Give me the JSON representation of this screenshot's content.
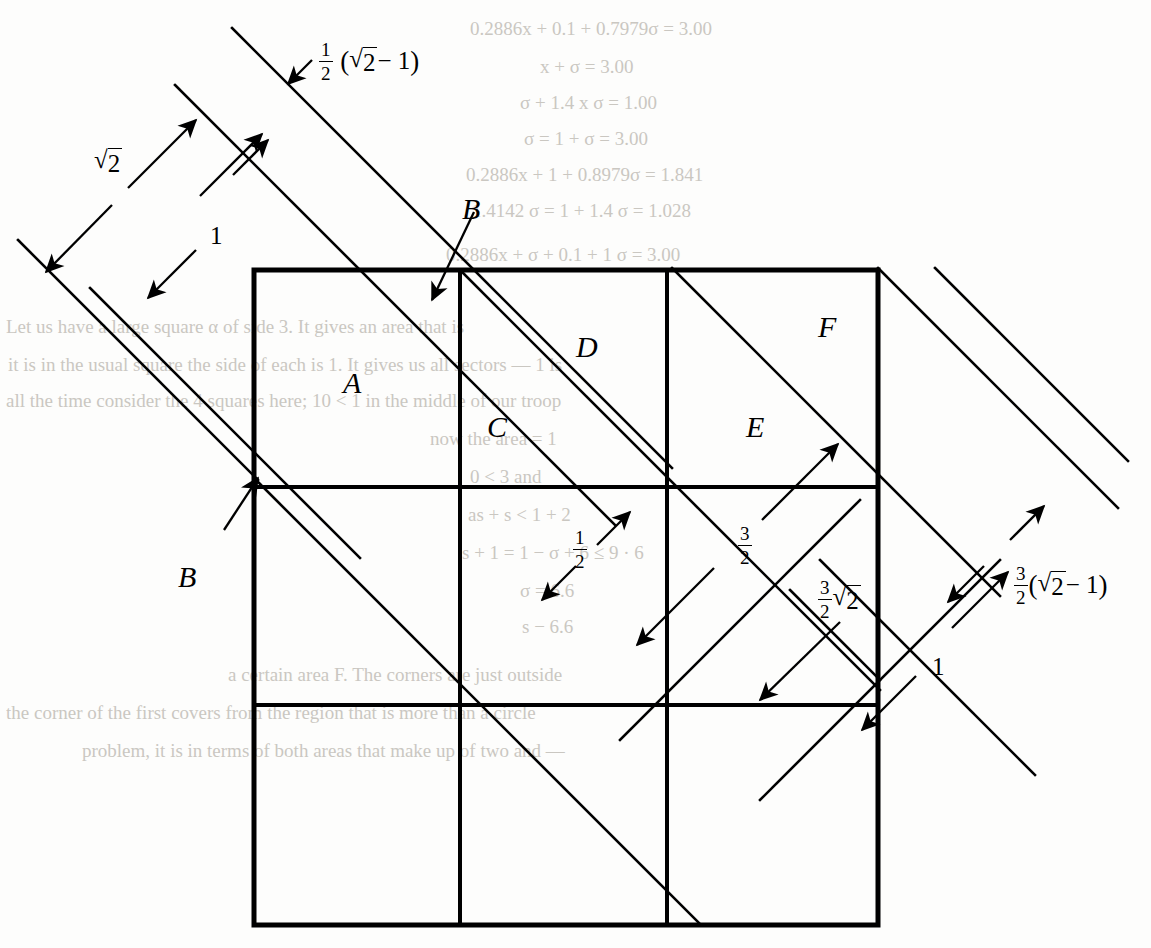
{
  "figure": {
    "grid": {
      "columns": 3,
      "rows": 3,
      "left": 254,
      "top": 270,
      "right": 878,
      "bottom": 925,
      "v_lines": [
        460,
        667
      ],
      "h_lines": [
        487,
        705
      ],
      "stroke": "#000000",
      "outer_width": 5,
      "inner_width": 4
    },
    "region_labels": [
      {
        "id": "A",
        "text": "A",
        "x": 343,
        "y": 366
      },
      {
        "id": "C",
        "text": "C",
        "x": 487,
        "y": 410
      },
      {
        "id": "D",
        "text": "D",
        "x": 576,
        "y": 330
      },
      {
        "id": "E",
        "text": "E",
        "x": 746,
        "y": 410
      },
      {
        "id": "F",
        "text": "F",
        "x": 818,
        "y": 310
      },
      {
        "id": "B_top",
        "text": "B",
        "x": 462,
        "y": 192
      },
      {
        "id": "B_left",
        "text": "B",
        "x": 178,
        "y": 560
      }
    ],
    "measure_labels": [
      {
        "id": "sqrt2",
        "kind": "radical",
        "text": "√2",
        "x": 94,
        "y": 148
      },
      {
        "id": "one_left",
        "kind": "plain",
        "text": "1",
        "x": 210,
        "y": 222
      },
      {
        "id": "half_sqrt2m1",
        "kind": "compound",
        "text": "½ (√2 − 1)",
        "x": 318,
        "y": 46
      },
      {
        "id": "one_half",
        "kind": "fraction",
        "text": "1/2",
        "x": 572,
        "y": 541
      },
      {
        "id": "three_half",
        "kind": "fraction",
        "text": "3/2",
        "x": 737,
        "y": 537
      },
      {
        "id": "three_half_sqrt2",
        "kind": "compound",
        "text": "3/2 √2",
        "x": 817,
        "y": 592
      },
      {
        "id": "three_half_sqrt2m1",
        "kind": "compound",
        "text": "3/2(√2 − 1)",
        "x": 1013,
        "y": 578
      },
      {
        "id": "one_right",
        "kind": "plain",
        "text": "1",
        "x": 932,
        "y": 653
      }
    ],
    "fraction_parts": {
      "half_num": "1",
      "half_den": "2",
      "three_half_num": "3",
      "three_half_den": "2"
    },
    "radical_parts": {
      "sign": "√",
      "radicand": "2",
      "minus_one": "− 1"
    },
    "colors": {
      "ink": "#000000",
      "page": "#fdfdfc",
      "ghost_text": "#b9b5ae"
    }
  },
  "background_text": {
    "note": "faint bleed-through text from the reverse page",
    "lines": [
      {
        "text": "0.2886x + 0.1 + 0.7979σ = 3.00",
        "x": 470,
        "y": 18
      },
      {
        "text": "x + σ = 3.00",
        "x": 540,
        "y": 56
      },
      {
        "text": "σ + 1.4 x σ = 1.00",
        "x": 520,
        "y": 92
      },
      {
        "text": "σ = 1 + σ = 3.00",
        "x": 524,
        "y": 128
      },
      {
        "text": "0.2886x + 1 + 0.8979σ = 1.841",
        "x": 466,
        "y": 164
      },
      {
        "text": "1.4142 σ = 1 + 1.4 σ = 1.028",
        "x": 472,
        "y": 200
      },
      {
        "text": "0.2886x + σ + 0.1 + 1 σ = 3.00",
        "x": 446,
        "y": 244
      },
      {
        "text": "Let us have a large square α of side 3. It gives an area that is",
        "x": 6,
        "y": 316
      },
      {
        "text": "it is in the usual square the side of each is 1. It gives us all sectors — 1 is",
        "x": 8,
        "y": 354
      },
      {
        "text": "all the time consider the 4 squares here; 10 < 1 in the middle of our troop",
        "x": 6,
        "y": 390
      },
      {
        "text": "now the area = 1",
        "x": 430,
        "y": 428
      },
      {
        "text": "0 < 3 and",
        "x": 470,
        "y": 466
      },
      {
        "text": "as + s < 1 + 2",
        "x": 468,
        "y": 504
      },
      {
        "text": "s + 1 = 1 − σ + 6 ≤ 9 · 6",
        "x": 462,
        "y": 542
      },
      {
        "text": "σ = 6.6",
        "x": 520,
        "y": 580
      },
      {
        "text": "s − 6.6",
        "x": 522,
        "y": 616
      },
      {
        "text": "a certain area F. The corners are just outside",
        "x": 228,
        "y": 664
      },
      {
        "text": "the corner of the first covers from the region that is more than a circle",
        "x": 6,
        "y": 702
      },
      {
        "text": "problem, it is in terms of both areas that make up of two and —",
        "x": 82,
        "y": 740
      }
    ]
  }
}
